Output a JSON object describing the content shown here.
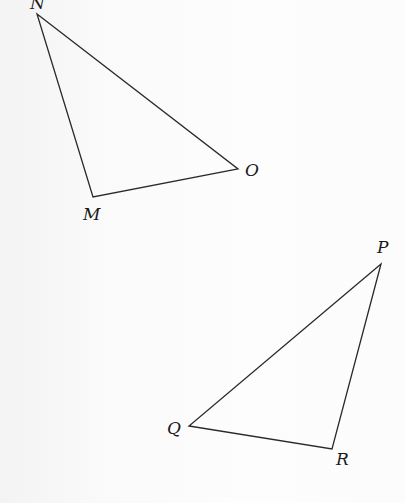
{
  "figure": {
    "stroke_color": "#2a2a2a",
    "background_color": "#fbfbfb",
    "triangles": [
      {
        "name": "MNO",
        "vertices": [
          {
            "label": "N",
            "x": 37,
            "y": 14,
            "label_x": 30,
            "label_y": -5
          },
          {
            "label": "O",
            "x": 238,
            "y": 169,
            "label_x": 245,
            "label_y": 162
          },
          {
            "label": "M",
            "x": 93,
            "y": 197,
            "label_x": 83,
            "label_y": 206
          }
        ]
      },
      {
        "name": "PQR",
        "vertices": [
          {
            "label": "P",
            "x": 381,
            "y": 264,
            "label_x": 377,
            "label_y": 239
          },
          {
            "label": "Q",
            "x": 189,
            "y": 426,
            "label_x": 167,
            "label_y": 420
          },
          {
            "label": "R",
            "x": 332,
            "y": 449,
            "label_x": 336,
            "label_y": 451
          }
        ]
      }
    ]
  },
  "labels": {
    "N": "N",
    "O": "O",
    "M": "M",
    "P": "P",
    "Q": "Q",
    "R": "R"
  }
}
